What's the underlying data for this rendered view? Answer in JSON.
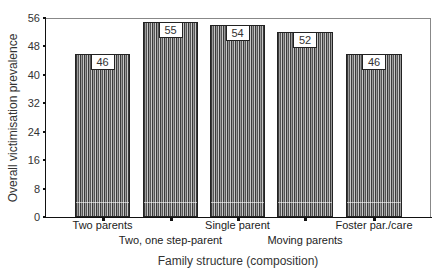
{
  "chart_data": {
    "type": "bar",
    "title": "",
    "xlabel": "Family structure (composition)",
    "ylabel": "Overall victimisation prevalence",
    "categories": [
      "Two parents",
      "Two, one step-parent",
      "Single parent",
      "Moving parents",
      "Foster par./care"
    ],
    "values": [
      46,
      55,
      54,
      52,
      46
    ],
    "data_labels": [
      "46",
      "55",
      "54",
      "52",
      "46"
    ],
    "ylim": [
      0,
      56
    ],
    "yticks": [
      0,
      8,
      16,
      24,
      32,
      40,
      48,
      56
    ],
    "ytick_labels": [
      "0",
      "8",
      "16",
      "24",
      "32",
      "40",
      "48",
      "56"
    ],
    "grid": false,
    "legend": null,
    "bar_fill": "vertical-hatch",
    "colors": {
      "bar_dark": "#3a3a3a",
      "bar_light": "#c8c8c8",
      "axis": "#111111"
    }
  }
}
